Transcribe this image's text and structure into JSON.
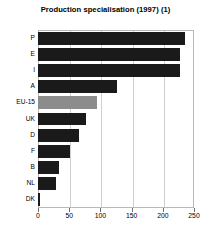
{
  "chart_data": {
    "type": "bar",
    "orientation": "horizontal",
    "title": "Production specialisation (1997) (1)",
    "subtitle": "",
    "xlabel": "",
    "ylabel": "",
    "categories": [
      "P",
      "E",
      "I",
      "A",
      "EU-15",
      "UK",
      "D",
      "F",
      "B",
      "NL",
      "DK"
    ],
    "values": [
      235,
      228,
      228,
      127,
      95,
      77,
      66,
      51,
      34,
      29,
      4
    ],
    "xlim": [
      0,
      250
    ],
    "xticks": [
      0,
      50,
      100,
      150,
      200,
      250
    ],
    "xtick_labels": [
      "0",
      "50",
      "100",
      "150",
      "200",
      "250"
    ],
    "grid": "vertical",
    "legend": "none",
    "annotations": [],
    "bar_colors": {
      "default": "#1a1a1a",
      "highlight": "#8c8c8c",
      "highlight_category": "EU-15"
    },
    "frame_color": "#b9b9b9",
    "gridline_color": "#cfcfcf",
    "background": "#ffffff"
  }
}
